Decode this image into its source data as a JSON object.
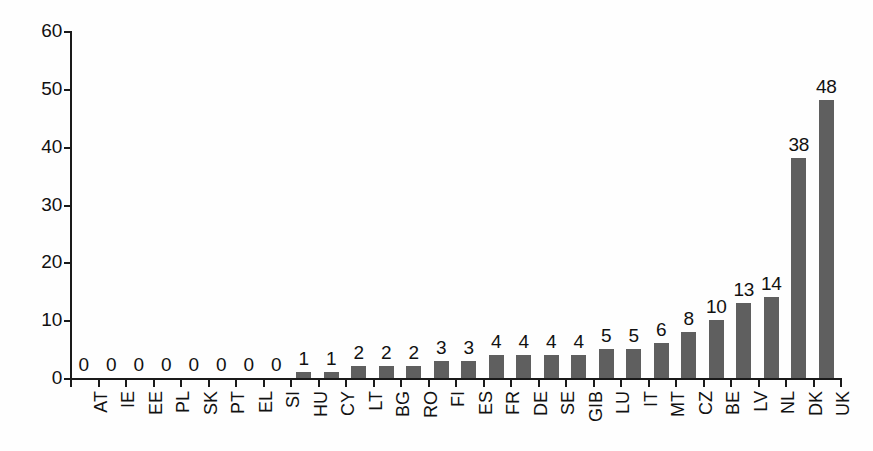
{
  "chart_data": {
    "type": "bar",
    "title": "",
    "subtitle": "",
    "xlabel": "",
    "ylabel": "",
    "ylim": [
      0,
      60
    ],
    "yticks": [
      0,
      10,
      20,
      30,
      40,
      50,
      60
    ],
    "grid": false,
    "legend": false,
    "bar_color": "#5f5f5f",
    "axis_color": "#1a1a1a",
    "text_color": "#111111",
    "background_color": "#fefefe",
    "show_value_labels": true,
    "categories": [
      "AT",
      "IE",
      "EE",
      "PL",
      "SK",
      "PT",
      "EL",
      "SI",
      "HU",
      "CY",
      "LT",
      "BG",
      "RO",
      "FI",
      "ES",
      "FR",
      "DE",
      "SE",
      "GIB",
      "LU",
      "IT",
      "MT",
      "CZ",
      "BE",
      "LV",
      "NL",
      "DK",
      "UK"
    ],
    "values": [
      0,
      0,
      0,
      0,
      0,
      0,
      0,
      0,
      1,
      1,
      2,
      2,
      2,
      3,
      3,
      4,
      4,
      4,
      4,
      5,
      5,
      6,
      8,
      10,
      13,
      14,
      38,
      48
    ],
    "value_labels": [
      "0",
      "0",
      "0",
      "0",
      "0",
      "0",
      "0",
      "0",
      "1",
      "1",
      "2",
      "2",
      "2",
      "3",
      "3",
      "4",
      "4",
      "4",
      "4",
      "5",
      "5",
      "6",
      "8",
      "10",
      "13",
      "14",
      "38",
      "48"
    ],
    "ytick_labels": [
      "0",
      "10",
      "20",
      "30",
      "40",
      "50",
      "60"
    ]
  }
}
